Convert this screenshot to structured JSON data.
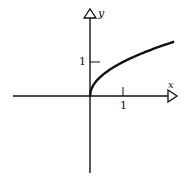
{
  "chart_data": {
    "type": "line",
    "title": "",
    "function": "y = sqrt(x)",
    "xlabel": "x",
    "ylabel": "y",
    "x_ticks": [
      {
        "value": 1,
        "label": "1"
      }
    ],
    "y_ticks": [
      {
        "value": 1,
        "label": "1"
      }
    ],
    "xlim": [
      -2.3,
      2.6
    ],
    "ylim": [
      -2.2,
      2.5
    ],
    "grid": false,
    "series": [
      {
        "name": "sqrt(x)",
        "x": [
          0,
          0.25,
          0.5,
          1,
          1.5,
          2,
          2.5
        ],
        "y": [
          0,
          0.5,
          0.71,
          1,
          1.22,
          1.41,
          1.58
        ]
      }
    ]
  },
  "labels": {
    "x_axis": "x",
    "y_axis": "y",
    "x_tick": "1",
    "y_tick": "1"
  }
}
